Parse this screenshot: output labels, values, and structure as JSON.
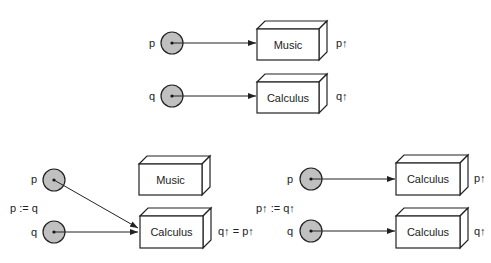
{
  "colors": {
    "stroke": "#222222",
    "circle_fill": "#c0c0c0",
    "box_fill": "#ffffff",
    "background": "#ffffff"
  },
  "panels": {
    "top": {
      "pointers": [
        {
          "name": "p"
        },
        {
          "name": "q"
        }
      ],
      "boxes": [
        {
          "content": "Music",
          "deref": "p↑"
        },
        {
          "content": "Calculus",
          "deref": "q↑"
        }
      ]
    },
    "bottom_left": {
      "assignment": "p := q",
      "pointers": [
        {
          "name": "p"
        },
        {
          "name": "q"
        }
      ],
      "boxes": [
        {
          "content": "Music"
        },
        {
          "content": "Calculus",
          "deref": "q↑ = p↑"
        }
      ]
    },
    "bottom_right": {
      "assignment": "p↑ := q↑",
      "pointers": [
        {
          "name": "p"
        },
        {
          "name": "q"
        }
      ],
      "boxes": [
        {
          "content": "Calculus",
          "deref": "p↑"
        },
        {
          "content": "Calculus",
          "deref": "q↑"
        }
      ]
    }
  }
}
